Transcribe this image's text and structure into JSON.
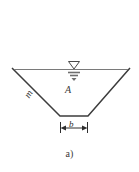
{
  "figure": {
    "caption": "a)",
    "type": "trapezoidal-channel-cross-section",
    "background_color": "#ffffff",
    "line_color": "#3c3c3c",
    "water_line_color": "#6b6b6b"
  },
  "labels": {
    "side_slope": "m",
    "flow_area": "A",
    "bottom_width": "b"
  },
  "geometry": {
    "top_left": [
      12,
      68
    ],
    "top_right": [
      130,
      68
    ],
    "bottom_left": [
      60,
      116
    ],
    "bottom_right": [
      88,
      116
    ],
    "water_surface_y": 69,
    "water_surface_x_start": 14,
    "water_surface_x_end": 128
  },
  "dimension": {
    "label": "b",
    "line_y": 128,
    "x_start": 60,
    "x_end": 88,
    "arrow_style": "outward-double",
    "extension_tick_height": 9
  },
  "icons": {
    "water_level": "water-surface-triangle-icon",
    "dimension_arrows": "dimension-arrow-icon"
  }
}
